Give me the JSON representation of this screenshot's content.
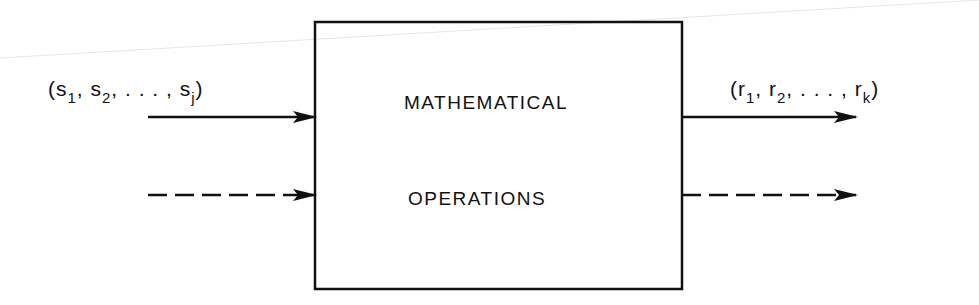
{
  "diagram": {
    "box": {
      "line1": "MATHEMATICAL",
      "line2": "OPERATIONS"
    },
    "input_label": {
      "open": "(s",
      "sub1": "1",
      "sep1": ", s",
      "sub2": "2",
      "sep2": ", . . . , s",
      "subj": "j",
      "close": ")"
    },
    "output_label": {
      "open": "(r",
      "sub1": "1",
      "sep1": ", r",
      "sub2": "2",
      "sep2": ", . . . , r",
      "subk": "k",
      "close": ")"
    },
    "arrows": [
      {
        "name": "input-solid",
        "style": "solid"
      },
      {
        "name": "input-dashed",
        "style": "dashed"
      },
      {
        "name": "output-solid",
        "style": "solid"
      },
      {
        "name": "output-dashed",
        "style": "dashed"
      }
    ],
    "ink_color": "#111111"
  }
}
